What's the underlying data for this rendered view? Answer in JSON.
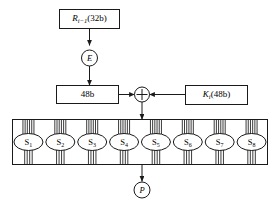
{
  "diagram": {
    "colors": {
      "stroke": "#1a1a1a",
      "background": "#ffffff",
      "fill": "#ffffff"
    },
    "input_box": {
      "name": "R_i-1(32b)",
      "var": "R",
      "subscript": "i−1",
      "suffix": "(32b)"
    },
    "expansion": {
      "label": "E",
      "meaning": "expansion-permutation"
    },
    "expanded_box": {
      "label": "48b"
    },
    "xor": {
      "label": "+",
      "meaning": "exclusive-or"
    },
    "key_box": {
      "name": "K_i(48b)",
      "var": "K",
      "subscript": "i",
      "suffix": "(48b)"
    },
    "sboxes": [
      {
        "label": "S",
        "subscript": "1",
        "inputs": 6,
        "outputs": 4
      },
      {
        "label": "S",
        "subscript": "2",
        "inputs": 6,
        "outputs": 4
      },
      {
        "label": "S",
        "subscript": "3",
        "inputs": 6,
        "outputs": 4
      },
      {
        "label": "S",
        "subscript": "4",
        "inputs": 6,
        "outputs": 4
      },
      {
        "label": "S",
        "subscript": "5",
        "inputs": 6,
        "outputs": 4
      },
      {
        "label": "S",
        "subscript": "6",
        "inputs": 6,
        "outputs": 4
      },
      {
        "label": "S",
        "subscript": "7",
        "inputs": 6,
        "outputs": 4
      },
      {
        "label": "S",
        "subscript": "8",
        "inputs": 6,
        "outputs": 4
      }
    ],
    "permutation": {
      "label": "P",
      "meaning": "permutation"
    }
  }
}
